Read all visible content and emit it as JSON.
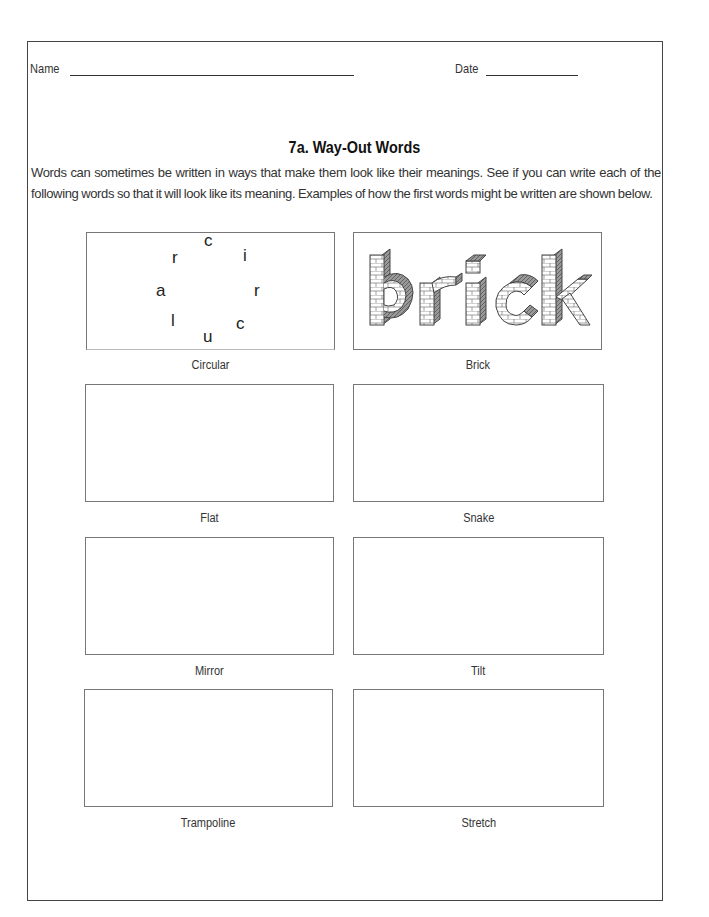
{
  "header": {
    "name_label": "Name",
    "date_label": "Date"
  },
  "title": "7a.  Way-Out Words",
  "intro": "Words can sometimes be written in ways that make them look like their meanings. See if you can write each of the following words so that it will look like its meaning. Examples of how the first words might be written are shown below.",
  "examples": {
    "circular_letters": [
      "c",
      "i",
      "r",
      "c",
      "u",
      "l",
      "a",
      "r"
    ],
    "brick_text": "brick"
  },
  "boxes": [
    {
      "label": "Circular"
    },
    {
      "label": "Brick"
    },
    {
      "label": "Flat"
    },
    {
      "label": "Snake"
    },
    {
      "label": "Mirror"
    },
    {
      "label": "Tilt"
    },
    {
      "label": "Trampoline"
    },
    {
      "label": "Stretch"
    }
  ]
}
